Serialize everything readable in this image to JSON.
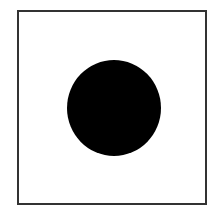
{
  "figure": {
    "frame": {
      "border_color": "#333333",
      "background": "#ffffff"
    },
    "circle": {
      "fill": "#000000",
      "shape": "filled-circle"
    }
  }
}
